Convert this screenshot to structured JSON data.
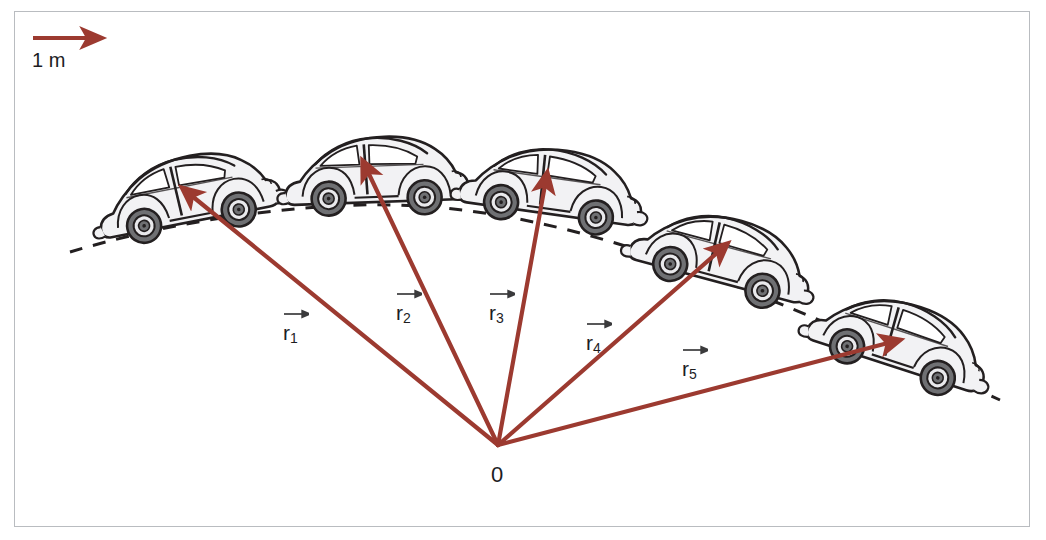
{
  "figure": {
    "title_text": "",
    "background": "#ffffff",
    "frame_color": "#b9bcc0",
    "vector_color": "#9c3a30",
    "car_outline_color": "#231f20",
    "car_body_color": "#f2f2f4",
    "car_glass_color": "#ffffff",
    "dash_color": "#231f20"
  },
  "scale": {
    "label": "1 m",
    "arrow_from": [
      33,
      38
    ],
    "arrow_to": [
      90,
      38
    ]
  },
  "origin": {
    "label": "0",
    "x": 498,
    "y": 445
  },
  "vectors": [
    {
      "id": "r1",
      "label": "r",
      "subscript": "1",
      "tip_x": 192,
      "tip_y": 196,
      "label_x": 283,
      "label_y": 322
    },
    {
      "id": "r2",
      "label": "r",
      "subscript": "2",
      "tip_x": 368,
      "tip_y": 172,
      "label_x": 396,
      "label_y": 302
    },
    {
      "id": "r3",
      "label": "r",
      "subscript": "3",
      "tip_x": 545,
      "tip_y": 185,
      "label_x": 489,
      "label_y": 302
    },
    {
      "id": "r4",
      "label": "r",
      "subscript": "4",
      "tip_x": 718,
      "tip_y": 252,
      "label_x": 586,
      "label_y": 332
    },
    {
      "id": "r5",
      "label": "r",
      "subscript": "5",
      "tip_x": 888,
      "tip_y": 343,
      "label_x": 682,
      "label_y": 358
    }
  ],
  "cars": [
    {
      "id": "car-1",
      "cx": 188,
      "cy": 200,
      "rotation": -11,
      "scale": 1.0
    },
    {
      "id": "car-2",
      "cx": 376,
      "cy": 180,
      "rotation": -2,
      "scale": 1.0
    },
    {
      "id": "car-3",
      "cx": 551,
      "cy": 192,
      "rotation": 8,
      "scale": 1.0
    },
    {
      "id": "car-4",
      "cx": 721,
      "cy": 260,
      "rotation": 15,
      "scale": 1.0
    },
    {
      "id": "car-5",
      "cx": 898,
      "cy": 345,
      "rotation": 18,
      "scale": 1.0
    }
  ],
  "trajectory": {
    "description": "dashed parabolic arc",
    "points": [
      [
        70,
        252
      ],
      [
        200,
        218
      ],
      [
        330,
        205
      ],
      [
        420,
        206
      ],
      [
        540,
        220
      ],
      [
        660,
        255
      ],
      [
        790,
        303
      ],
      [
        935,
        372
      ],
      [
        1000,
        400
      ]
    ]
  }
}
